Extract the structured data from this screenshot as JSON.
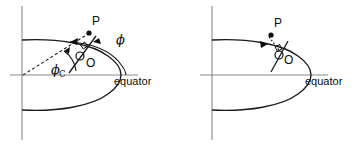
{
  "figure": {
    "background_color": "#ffffff",
    "stroke_color": "#1a1a1a",
    "axis_color": "#8a8a8a",
    "width": 360,
    "height": 146
  },
  "panels": [
    {
      "id": "left",
      "name": "geodetic-and-geocentric-latitude",
      "labels": {
        "point_p": "P",
        "point_o": "O",
        "equator": "equator",
        "phi": "ϕ",
        "phi_c": "ϕ",
        "phi_c_subscript": "C"
      },
      "elements": {
        "vertical_axis": true,
        "horizontal_axis": true,
        "ellipse_outline": true,
        "tangent_line": true,
        "normal_dashed_line": true,
        "geocentric_dashed_line": true,
        "right_angle_marker": true,
        "angle_arc_phi": true,
        "angle_arc_phi_c": true,
        "arrow_heads": 4
      }
    },
    {
      "id": "right",
      "name": "surface-normal-only",
      "labels": {
        "point_p": "P",
        "point_o": "O",
        "equator": "equator"
      },
      "elements": {
        "vertical_axis": true,
        "horizontal_axis": true,
        "ellipse_outline": true,
        "tangent_line": true,
        "normal_dotted_line": true,
        "right_angle_marker": true,
        "arrow_heads": 1
      }
    }
  ]
}
